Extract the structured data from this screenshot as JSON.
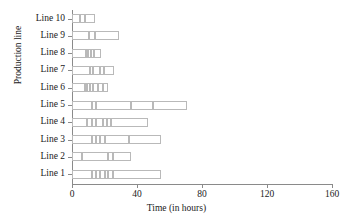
{
  "chart_data": {
    "type": "bar",
    "orientation": "horizontal",
    "stacked": true,
    "title": "",
    "xlabel": "Time (in hours)",
    "ylabel": "Production line",
    "xlim": [
      0,
      160
    ],
    "xticks": [
      0,
      40,
      80,
      120,
      160
    ],
    "xticklabels": [
      "0",
      "40",
      "80",
      "120",
      "160"
    ],
    "grid": false,
    "legend": "none",
    "categories": [
      "Line 1",
      "Line 2",
      "Line 3",
      "Line 4",
      "Line 5",
      "Line 6",
      "Line 7",
      "Line 8",
      "Line 9",
      "Line 10"
    ],
    "totals": [
      55,
      36,
      55,
      47,
      71,
      22,
      26,
      18,
      29,
      14
    ],
    "bars": [
      {
        "category": "Line 1",
        "total": 55,
        "segments": [
          12.5,
          2.5,
          2.5,
          2.5,
          2.0,
          3.0,
          30.0
        ]
      },
      {
        "category": "Line 2",
        "total": 36,
        "segments": [
          6.0,
          16.0,
          3.0,
          11.0
        ]
      },
      {
        "category": "Line 3",
        "total": 55,
        "segments": [
          12.0,
          3.0,
          2.5,
          2.5,
          15.0,
          20.0
        ]
      },
      {
        "category": "Line 4",
        "total": 47,
        "segments": [
          9.5,
          2.5,
          3.0,
          4.0,
          2.5,
          2.5,
          23.0
        ]
      },
      {
        "category": "Line 5",
        "total": 71,
        "segments": [
          12.5,
          2.5,
          21.0,
          14.0,
          21.0
        ]
      },
      {
        "category": "Line 6",
        "total": 22,
        "segments": [
          8.0,
          1.5,
          1.5,
          2.0,
          3.0,
          3.0,
          3.0
        ]
      },
      {
        "category": "Line 7",
        "total": 26,
        "segments": [
          11.0,
          2.0,
          4.0,
          2.5,
          6.5
        ]
      },
      {
        "category": "Line 8",
        "total": 18,
        "segments": [
          8.5,
          1.5,
          1.5,
          2.0,
          4.5
        ]
      },
      {
        "category": "Line 9",
        "total": 29,
        "segments": [
          10.5,
          3.5,
          15.0
        ]
      },
      {
        "category": "Line 10",
        "total": 14,
        "segments": [
          5.0,
          3.0,
          6.0
        ]
      }
    ]
  },
  "axes": {
    "x_title": "Time (in hours)",
    "y_title": "Production line",
    "x_tick_labels": [
      "0",
      "40",
      "80",
      "120",
      "160"
    ],
    "y_tick_labels": [
      "Line 10",
      "Line 9",
      "Line 8",
      "Line 7",
      "Line 6",
      "Line 5",
      "Line 4",
      "Line 3",
      "Line 2",
      "Line 1"
    ]
  },
  "style": {
    "bar_edge_color": "#b9b9b9",
    "bar_fill_color": "#ffffff",
    "axis_color": "#8a8a8a",
    "text_color": "#1a1a1a",
    "background": "#ffffff"
  }
}
